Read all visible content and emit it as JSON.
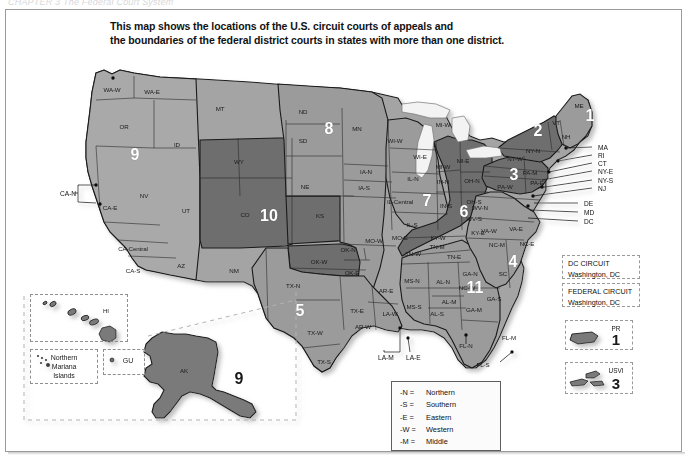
{
  "page": {
    "cut_header": "CHAPTER 3     The Federal Court System",
    "title_line1": "This map shows the locations of the U.S. circuit courts of appeals and",
    "title_line2": "the boundaries of the federal district courts in states with more than one district.",
    "background": "#ffffff",
    "frame_border": "#9a9a9a"
  },
  "colors": {
    "shade_light": "#a9a9a9",
    "shade_mid": "#9b9b9b",
    "shade_dark": "#6e6e6e",
    "shade_darker": "#5d5d5d",
    "outline": "#1a1a1a",
    "water": "#f2f2f2",
    "circuit_number": "#ffffff"
  },
  "circuit_numbers": [
    {
      "label": "1",
      "x": 590,
      "y": 116,
      "dark": false
    },
    {
      "label": "2",
      "x": 538,
      "y": 131,
      "dark": false
    },
    {
      "label": "3",
      "x": 514,
      "y": 175,
      "dark": false
    },
    {
      "label": "4",
      "x": 513,
      "y": 262,
      "dark": false
    },
    {
      "label": "5",
      "x": 300,
      "y": 311,
      "dark": false
    },
    {
      "label": "6",
      "x": 464,
      "y": 212,
      "dark": false
    },
    {
      "label": "7",
      "x": 427,
      "y": 201,
      "dark": false
    },
    {
      "label": "8",
      "x": 329,
      "y": 129,
      "dark": false
    },
    {
      "label": "9",
      "x": 135,
      "y": 155,
      "dark": false
    },
    {
      "label": "10",
      "x": 269,
      "y": 216,
      "dark": false
    },
    {
      "label": "11",
      "x": 475,
      "y": 288,
      "dark": false
    },
    {
      "label": "9",
      "x": 239,
      "y": 379,
      "dark": true
    }
  ],
  "state_labels": [
    {
      "t": "WA-W",
      "x": 112,
      "y": 89
    },
    {
      "t": "WA-E",
      "x": 152,
      "y": 91
    },
    {
      "t": "OR",
      "x": 124,
      "y": 126
    },
    {
      "t": "ID",
      "x": 177,
      "y": 144
    },
    {
      "t": "MT",
      "x": 220,
      "y": 108
    },
    {
      "t": "NV",
      "x": 144,
      "y": 195
    },
    {
      "t": "CA-E",
      "x": 110,
      "y": 207
    },
    {
      "t": "CA-Central",
      "x": 133,
      "y": 248
    },
    {
      "t": "CA-S",
      "x": 133,
      "y": 270
    },
    {
      "t": "UT",
      "x": 186,
      "y": 210
    },
    {
      "t": "AZ",
      "x": 181,
      "y": 265
    },
    {
      "t": "WY",
      "x": 239,
      "y": 161
    },
    {
      "t": "CO",
      "x": 245,
      "y": 214
    },
    {
      "t": "NM",
      "x": 234,
      "y": 270
    },
    {
      "t": "ND",
      "x": 303,
      "y": 111
    },
    {
      "t": "SD",
      "x": 303,
      "y": 140
    },
    {
      "t": "NE",
      "x": 305,
      "y": 186
    },
    {
      "t": "KS",
      "x": 320,
      "y": 215
    },
    {
      "t": "MN",
      "x": 357,
      "y": 128
    },
    {
      "t": "IA-N",
      "x": 366,
      "y": 171
    },
    {
      "t": "IA-S",
      "x": 364,
      "y": 187
    },
    {
      "t": "MO-W",
      "x": 374,
      "y": 240
    },
    {
      "t": "MO-E",
      "x": 400,
      "y": 237
    },
    {
      "t": "OK-W",
      "x": 319,
      "y": 261
    },
    {
      "t": "OK-N",
      "x": 348,
      "y": 249
    },
    {
      "t": "OK-E",
      "x": 352,
      "y": 272
    },
    {
      "t": "TX-N",
      "x": 293,
      "y": 285
    },
    {
      "t": "TX-W",
      "x": 315,
      "y": 332
    },
    {
      "t": "TX-S",
      "x": 324,
      "y": 361
    },
    {
      "t": "TX-E",
      "x": 357,
      "y": 310
    },
    {
      "t": "AR-E",
      "x": 386,
      "y": 290
    },
    {
      "t": "AR-W",
      "x": 363,
      "y": 326
    },
    {
      "t": "LA-W",
      "x": 390,
      "y": 313
    },
    {
      "t": "WI-W",
      "x": 395,
      "y": 140
    },
    {
      "t": "WI-E",
      "x": 420,
      "y": 156
    },
    {
      "t": "MI-W",
      "x": 443,
      "y": 124
    },
    {
      "t": "MI-E",
      "x": 463,
      "y": 160
    },
    {
      "t": "MI-W",
      "x": 443,
      "y": 166
    },
    {
      "t": "IL-N",
      "x": 413,
      "y": 178
    },
    {
      "t": "IL-Central",
      "x": 400,
      "y": 201
    },
    {
      "t": "IL-S",
      "x": 412,
      "y": 224
    },
    {
      "t": "IN-N",
      "x": 443,
      "y": 181
    },
    {
      "t": "IN-S",
      "x": 446,
      "y": 205
    },
    {
      "t": "OH-N",
      "x": 472,
      "y": 180
    },
    {
      "t": "OH-S",
      "x": 474,
      "y": 201
    },
    {
      "t": "KY-W",
      "x": 438,
      "y": 237
    },
    {
      "t": "KY-E",
      "x": 478,
      "y": 232
    },
    {
      "t": "TN-W",
      "x": 413,
      "y": 253
    },
    {
      "t": "TN-M",
      "x": 437,
      "y": 246
    },
    {
      "t": "TN-E",
      "x": 454,
      "y": 256
    },
    {
      "t": "MS-N",
      "x": 412,
      "y": 280
    },
    {
      "t": "MS-S",
      "x": 414,
      "y": 306
    },
    {
      "t": "AL-N",
      "x": 443,
      "y": 281
    },
    {
      "t": "AL-M",
      "x": 449,
      "y": 301
    },
    {
      "t": "AL-S",
      "x": 437,
      "y": 313
    },
    {
      "t": "GA-N",
      "x": 470,
      "y": 273
    },
    {
      "t": "GA-M",
      "x": 474,
      "y": 309
    },
    {
      "t": "GA-S",
      "x": 494,
      "y": 298
    },
    {
      "t": "SC",
      "x": 503,
      "y": 273
    },
    {
      "t": "NC-W",
      "x": 467,
      "y": 287
    },
    {
      "t": "NC-M",
      "x": 497,
      "y": 244
    },
    {
      "t": "NC-E",
      "x": 527,
      "y": 243
    },
    {
      "t": "VA-W",
      "x": 489,
      "y": 230
    },
    {
      "t": "VA-E",
      "x": 516,
      "y": 228
    },
    {
      "t": "WV-N",
      "x": 480,
      "y": 207
    },
    {
      "t": "WV-S",
      "x": 474,
      "y": 218
    },
    {
      "t": "PA-W",
      "x": 505,
      "y": 186
    },
    {
      "t": "PA-M",
      "x": 530,
      "y": 172
    },
    {
      "t": "PA-E",
      "x": 537,
      "y": 182
    },
    {
      "t": "NY-W",
      "x": 515,
      "y": 158
    },
    {
      "t": "NY-N",
      "x": 533,
      "y": 150
    },
    {
      "t": "VT",
      "x": 556,
      "y": 122
    },
    {
      "t": "NH",
      "x": 566,
      "y": 136
    },
    {
      "t": "ME",
      "x": 579,
      "y": 105
    },
    {
      "t": "FL-N",
      "x": 466,
      "y": 345
    },
    {
      "t": "FL-M",
      "x": 509,
      "y": 337
    },
    {
      "t": "FL-S",
      "x": 483,
      "y": 364
    },
    {
      "t": "AK",
      "x": 184,
      "y": 370
    },
    {
      "t": "HI",
      "x": 106,
      "y": 310
    }
  ],
  "leader_labels": [
    {
      "t": "MA",
      "x": 598,
      "y": 147
    },
    {
      "t": "RI",
      "x": 598,
      "y": 155
    },
    {
      "t": "CT",
      "x": 598,
      "y": 163
    },
    {
      "t": "NY-E",
      "x": 598,
      "y": 171
    },
    {
      "t": "NY-S",
      "x": 598,
      "y": 180
    },
    {
      "t": "NJ",
      "x": 598,
      "y": 188
    },
    {
      "t": "DE",
      "x": 584,
      "y": 203
    },
    {
      "t": "MD",
      "x": 584,
      "y": 212
    },
    {
      "t": "DC",
      "x": 584,
      "y": 221
    },
    {
      "t": "CA-N",
      "x": 60,
      "y": 193
    },
    {
      "t": "LA-M",
      "x": 378,
      "y": 357
    },
    {
      "t": "LA-E",
      "x": 406,
      "y": 357
    }
  ],
  "legend_boxes": [
    {
      "name": "dc-circuit",
      "line1": "DC CIRCUIT",
      "line2": "Washington, DC",
      "x": 562,
      "y": 255,
      "w": 78,
      "h": 24
    },
    {
      "name": "federal-circuit",
      "line1": "FEDERAL CIRCUIT",
      "line2": "Washington, DC",
      "x": 562,
      "y": 283,
      "w": 78,
      "h": 24
    }
  ],
  "territory_boxes": [
    {
      "name": "puerto-rico",
      "tag": "PR",
      "num": "1",
      "x": 565,
      "y": 320,
      "w": 68,
      "h": 30
    },
    {
      "name": "usvi",
      "tag": "USVI",
      "num": "3",
      "x": 565,
      "y": 362,
      "w": 68,
      "h": 32
    }
  ],
  "inset_boxes": [
    {
      "name": "hawaii-inset",
      "x": 30,
      "y": 294,
      "w": 98,
      "h": 48
    },
    {
      "name": "mariana-islands-inset",
      "x": 30,
      "y": 349,
      "w": 68,
      "h": 35
    },
    {
      "name": "guam-inset",
      "x": 103,
      "y": 349,
      "w": 42,
      "h": 26
    }
  ],
  "inset_labels": [
    {
      "t": "Northern",
      "x": 64,
      "y": 357
    },
    {
      "t": "Mariana",
      "x": 64,
      "y": 366
    },
    {
      "t": "Islands",
      "x": 64,
      "y": 375
    },
    {
      "t": "GU",
      "x": 128,
      "y": 360
    }
  ],
  "abbreviations": {
    "rows": [
      {
        "key": "-N =",
        "value": "Northern"
      },
      {
        "key": "-S =",
        "value": "Southern"
      },
      {
        "key": "-E =",
        "value": "Eastern"
      },
      {
        "key": "-W =",
        "value": "Western"
      },
      {
        "key": "-M =",
        "value": "Middle"
      }
    ]
  }
}
